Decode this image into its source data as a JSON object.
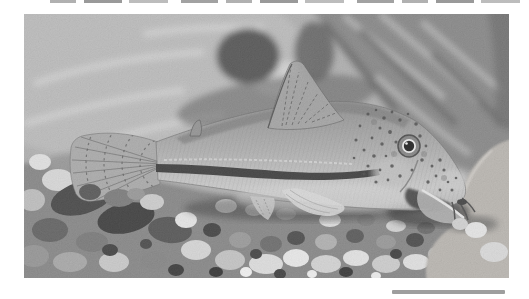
{
  "image": {
    "description": "Grayscale photograph of a Corydoras catfish resting on mixed light and dark aquarium gravel in front of large blurred rocks, facing right, with a dark lateral stripe, speckled head, raised striped dorsal fin and striped tail fin"
  },
  "colors": {
    "page_bg": "#ffffff",
    "photo_base": "#a8a8a8",
    "rock_upper_left": "#b5b5b5",
    "rock_upper_right": "#7d7d7d",
    "rock_foreground_right": "#b3afa9",
    "gravel_base": "#7b7b7b",
    "fish_body_dark": "#858585",
    "fish_body_light": "#c6c6c6",
    "lateral_stripe": "#2e2e2e",
    "eye_pupil": "#0e0e0e",
    "eye_ring": "#e9e9e9",
    "scale_bar": "#9e9e9e",
    "top_edge_fragment": "#8f8f8f"
  }
}
